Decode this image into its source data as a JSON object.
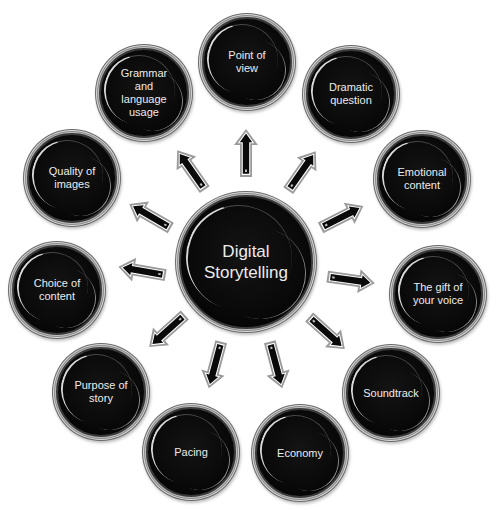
{
  "diagram": {
    "type": "radial-hub-and-spoke",
    "colors": {
      "background": "#ffffff",
      "node_fill": "#000000",
      "node_text": "#ececec",
      "node_ring": "#bdbdbd",
      "arrow_fill": "#0a0a0a",
      "arrow_outline": "#9a9a9a"
    },
    "center": {
      "label": "Digital\nStorytelling",
      "cx": 246,
      "cy": 262,
      "r": 67
    },
    "nodes": [
      {
        "id": "point-of-view",
        "label": "Point of\nview",
        "cx": 247,
        "cy": 62,
        "r": 45
      },
      {
        "id": "dramatic-question",
        "label": "Dramatic\nquestion",
        "cx": 351,
        "cy": 94,
        "r": 45
      },
      {
        "id": "emotional-content",
        "label": "Emotional\ncontent",
        "cx": 422,
        "cy": 179,
        "r": 45
      },
      {
        "id": "gift-of-voice",
        "label": "The gift of\nyour voice",
        "cx": 438,
        "cy": 294,
        "r": 45
      },
      {
        "id": "soundtrack",
        "label": "Soundtrack",
        "cx": 391,
        "cy": 393,
        "r": 45
      },
      {
        "id": "economy",
        "label": "Economy",
        "cx": 300,
        "cy": 453,
        "r": 45
      },
      {
        "id": "pacing",
        "label": "Pacing",
        "cx": 191,
        "cy": 452,
        "r": 45
      },
      {
        "id": "purpose-of-story",
        "label": "Purpose of\nstory",
        "cx": 101,
        "cy": 392,
        "r": 45
      },
      {
        "id": "choice-of-content",
        "label": "Choice of\ncontent",
        "cx": 57,
        "cy": 290,
        "r": 45
      },
      {
        "id": "quality-of-images",
        "label": "Quality of\nimages",
        "cx": 72,
        "cy": 178,
        "r": 45
      },
      {
        "id": "grammar-language-usage",
        "label": "Grammar\nand\nlanguage\nusage",
        "cx": 144,
        "cy": 93,
        "r": 45
      }
    ],
    "arrows": [
      {
        "target": "point-of-view",
        "cx": 246,
        "cy": 153,
        "angle": -90
      },
      {
        "target": "dramatic-question",
        "cx": 302,
        "cy": 171,
        "angle": -55
      },
      {
        "target": "emotional-content",
        "cx": 342,
        "cy": 217,
        "angle": -27
      },
      {
        "target": "gift-of-voice",
        "cx": 351,
        "cy": 280,
        "angle": 8
      },
      {
        "target": "soundtrack",
        "cx": 327,
        "cy": 333,
        "angle": 42
      },
      {
        "target": "economy",
        "cx": 276,
        "cy": 365,
        "angle": 75
      },
      {
        "target": "pacing",
        "cx": 215,
        "cy": 365,
        "angle": 105
      },
      {
        "target": "purpose-of-story",
        "cx": 167,
        "cy": 331,
        "angle": 138
      },
      {
        "target": "choice-of-content",
        "cx": 142,
        "cy": 271,
        "angle": 190
      },
      {
        "target": "quality-of-images",
        "cx": 150,
        "cy": 216,
        "angle": 210
      },
      {
        "target": "grammar-language-usage",
        "cx": 191,
        "cy": 170,
        "angle": 235
      }
    ]
  }
}
